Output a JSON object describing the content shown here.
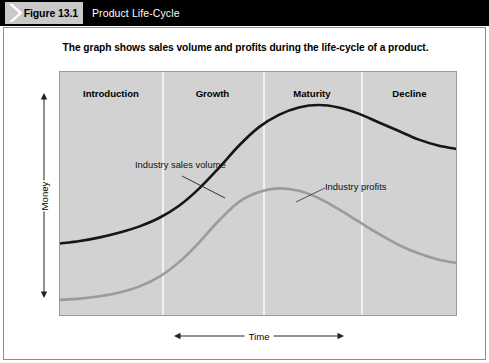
{
  "header": {
    "figure_number": "Figure 13.1",
    "title": "Product Life-Cycle",
    "bar_color": "#000000",
    "number_box_color": "#c9c9c9",
    "title_color": "#ffffff"
  },
  "caption": "The graph shows sales volume and profits during the life-cycle of a product.",
  "chart_data": {
    "type": "line",
    "title": "The graph shows sales volume and profits during the life-cycle of a product.",
    "xlabel": "Time",
    "ylabel": "Money",
    "grid": false,
    "legend": "inline-annotations",
    "plot_background": "#d2d2d2",
    "divider_color": "#f2f2f2",
    "stages": [
      {
        "label": "Introduction",
        "start": 0,
        "end": 25.6
      },
      {
        "label": "Growth",
        "start": 25.6,
        "end": 51.0
      },
      {
        "label": "Maturity",
        "start": 51.0,
        "end": 75.6
      },
      {
        "label": "Decline",
        "start": 75.6,
        "end": 100
      }
    ],
    "stage_boundaries_pct": [
      25.6,
      51.0,
      75.6
    ],
    "x": [
      0,
      5,
      10,
      15,
      20,
      25,
      30,
      35,
      40,
      45,
      50,
      55,
      60,
      65,
      70,
      75,
      80,
      85,
      90,
      95,
      100
    ],
    "series": [
      {
        "name": "Industry sales volume",
        "color": "#161616",
        "width": 2.6,
        "values": [
          30,
          31,
          32.5,
          34.5,
          37,
          40.5,
          45.5,
          52.5,
          61,
          70,
          77.5,
          82.5,
          85.5,
          86.5,
          85.5,
          83,
          79.5,
          76,
          72.5,
          70,
          68.5
        ]
      },
      {
        "name": "Industry profits",
        "color": "#9b9b9b",
        "width": 2.6,
        "values": [
          7,
          7.5,
          8.5,
          10,
          12.5,
          16.5,
          22.5,
          30.5,
          39.5,
          47,
          51,
          52.5,
          51.5,
          48.5,
          44,
          39,
          34,
          29.5,
          26,
          23.5,
          22
        ]
      }
    ],
    "annotations": [
      {
        "name": "industry-sales-volume-label",
        "text": "Industry sales\nvolume",
        "leader": true
      },
      {
        "name": "industry-profits-label",
        "text": "Industry profits",
        "leader": true
      }
    ],
    "ylim": [
      0,
      100
    ],
    "xlim": [
      0,
      100
    ]
  },
  "axes": {
    "y_label": "Money",
    "x_label": "Time"
  }
}
